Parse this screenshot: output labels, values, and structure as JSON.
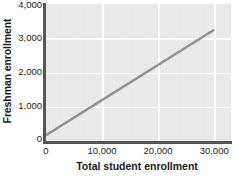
{
  "chart_data": {
    "type": "line",
    "title": "",
    "xlabel": "Total student enrollment",
    "ylabel": "Freshman enrollment",
    "xlim": [
      0,
      33000
    ],
    "ylim": [
      0,
      4000
    ],
    "grid": true,
    "legend": false,
    "xticks": [
      0,
      10000,
      20000,
      30000
    ],
    "xticklabels": [
      "0",
      "10,000",
      "20,000",
      "30,000"
    ],
    "yticks": [
      0,
      1000,
      2000,
      3000,
      4000
    ],
    "yticklabels": [
      "0",
      "1,000",
      "2,000",
      "3,000",
      "4,000"
    ],
    "series": [
      {
        "name": "Regression line",
        "x": [
          0,
          30000
        ],
        "y": [
          170,
          3250
        ],
        "color": "#8f8f8f",
        "linewidth": 2
      }
    ],
    "plot_background": "#e8e8e8",
    "gridline_color": "#fdfdfd",
    "axis_color": "#555555",
    "text_color": "#1b1b1b"
  }
}
